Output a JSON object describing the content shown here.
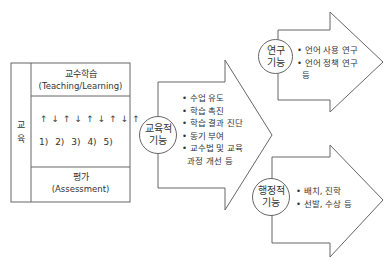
{
  "left_table": {
    "side_label": [
      "교",
      "육"
    ],
    "top": {
      "ko": "교수학습",
      "en": "(Teaching/Learning)"
    },
    "middle": {
      "arrows": "↑↓↑↓↑↓↑↓↑",
      "numbers": [
        "1)",
        "2)",
        "3)",
        "4)",
        "5)"
      ]
    },
    "bottom": {
      "ko": "평가",
      "en": "(Assessment)"
    }
  },
  "education_function": {
    "circle": [
      "교육적",
      "기능"
    ],
    "items": [
      "• 수업 유도",
      "• 학습 촉진",
      "• 학습 결과 진단",
      "• 동기 부여",
      "• 교수법 및 교육",
      "  과정 개선 등"
    ]
  },
  "research_function": {
    "circle": [
      "연구",
      "기능"
    ],
    "items": [
      "• 언어 사용 연구",
      "• 언어 정책 연구",
      "  등"
    ]
  },
  "admin_function": {
    "circle": [
      "행정적",
      "기능"
    ],
    "items": [
      "• 배치, 진학",
      "• 선발, 수상 등"
    ]
  },
  "colors": {
    "line": "#666666",
    "text": "#333333",
    "background": "#ffffff"
  }
}
